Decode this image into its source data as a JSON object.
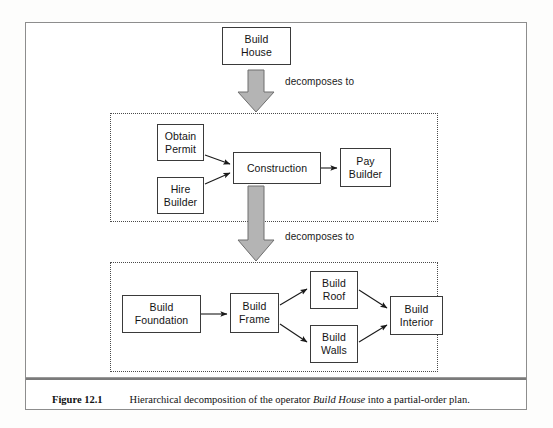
{
  "figure": {
    "caption_number": "Figure 12.1",
    "caption_prefix": "Hierarchical decomposition of the operator ",
    "caption_emphasis": "Build House",
    "caption_suffix": " into a partial-order plan."
  },
  "colors": {
    "node_border": "#3a3a3a",
    "node_fill": "#ffffff",
    "group_border": "#4a4a4a",
    "block_arrow_fill": "#b4b4b4",
    "block_arrow_stroke": "#6e6e6e",
    "connector": "#1a1a1a",
    "frame": "#8d8d8d"
  },
  "root": {
    "label_line1": "Build",
    "label_line2": "House"
  },
  "decompose_labels": [
    {
      "text": "decomposes to"
    },
    {
      "text": "decomposes to"
    }
  ],
  "level1": {
    "nodes": [
      {
        "id": "obtain-permit",
        "label_line1": "Obtain",
        "label_line2": "Permit"
      },
      {
        "id": "hire-builder",
        "label_line1": "Hire",
        "label_line2": "Builder"
      },
      {
        "id": "construction",
        "label_line1": "Construction",
        "label_line2": ""
      },
      {
        "id": "pay-builder",
        "label_line1": "Pay",
        "label_line2": "Builder"
      }
    ],
    "edges": [
      {
        "from": "obtain-permit",
        "to": "construction"
      },
      {
        "from": "hire-builder",
        "to": "construction"
      },
      {
        "from": "construction",
        "to": "pay-builder"
      }
    ]
  },
  "level2": {
    "nodes": [
      {
        "id": "build-foundation",
        "label_line1": "Build",
        "label_line2": "Foundation"
      },
      {
        "id": "build-frame",
        "label_line1": "Build",
        "label_line2": "Frame"
      },
      {
        "id": "build-roof",
        "label_line1": "Build",
        "label_line2": "Roof"
      },
      {
        "id": "build-walls",
        "label_line1": "Build",
        "label_line2": "Walls"
      },
      {
        "id": "build-interior",
        "label_line1": "Build",
        "label_line2": "Interior"
      }
    ],
    "edges": [
      {
        "from": "build-foundation",
        "to": "build-frame"
      },
      {
        "from": "build-frame",
        "to": "build-roof"
      },
      {
        "from": "build-frame",
        "to": "build-walls"
      },
      {
        "from": "build-roof",
        "to": "build-interior"
      },
      {
        "from": "build-walls",
        "to": "build-interior"
      }
    ]
  }
}
